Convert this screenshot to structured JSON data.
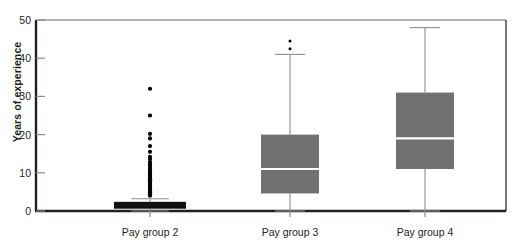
{
  "chart_data": {
    "type": "box",
    "title": "",
    "xlabel": "",
    "ylabel": "Years of experience",
    "ylim": [
      0,
      50
    ],
    "yticks": [
      0,
      10,
      20,
      30,
      40,
      50
    ],
    "ytick_labels": [
      "0",
      "10",
      "20",
      "30",
      "40",
      "50"
    ],
    "grid": false,
    "legend": "none",
    "categories": [
      "Pay group 2",
      "Pay group 3",
      "Pay group 4"
    ],
    "box_fill_color": "#707070",
    "median_line_color": "#ffffff",
    "whisker_color": "#8c8c8c",
    "outlier_color": "#000000",
    "axis_color": "#231f20",
    "series": [
      {
        "name": "Pay group 2",
        "q1": 0.6,
        "median": 1.0,
        "q3": 2.4,
        "whisker_low": 0.0,
        "whisker_high": 3.2,
        "outliers": [
          4.0,
          4.4,
          4.9,
          5.4,
          5.9,
          6.3,
          6.8,
          7.3,
          7.8,
          8.3,
          8.8,
          9.3,
          9.8,
          10.3,
          10.8,
          11.3,
          11.8,
          12.3,
          12.8,
          13.6,
          14.2,
          15.5,
          17.0,
          19.0,
          20.2,
          25.0,
          32.0
        ]
      },
      {
        "name": "Pay group 3",
        "q1": 4.6,
        "median": 11.0,
        "q3": 20.0,
        "whisker_low": 0.0,
        "whisker_high": 41.0,
        "outliers": [
          42.5,
          44.5
        ]
      },
      {
        "name": "Pay group 4",
        "q1": 11.0,
        "median": 19.0,
        "q3": 31.0,
        "whisker_low": 0.0,
        "whisker_high": 48.0,
        "outliers": []
      }
    ]
  },
  "axis": {
    "y_title": "Years of experience",
    "y_tick_0": "0",
    "y_tick_10": "10",
    "y_tick_20": "20",
    "y_tick_30": "30",
    "y_tick_40": "40",
    "y_tick_50": "50",
    "x_cat_0": "Pay group 2",
    "x_cat_1": "Pay group 3",
    "x_cat_2": "Pay group 4"
  }
}
